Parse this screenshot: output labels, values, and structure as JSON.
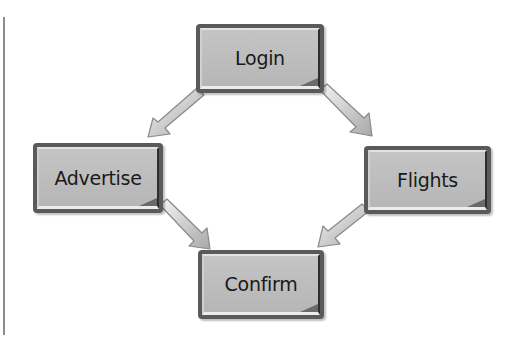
{
  "diagram": {
    "type": "flow",
    "nodes": [
      {
        "id": "login",
        "label": "Login"
      },
      {
        "id": "advertise",
        "label": "Advertise"
      },
      {
        "id": "flights",
        "label": "Flights"
      },
      {
        "id": "confirm",
        "label": "Confirm"
      }
    ],
    "edges": [
      {
        "from": "login",
        "to": "advertise"
      },
      {
        "from": "login",
        "to": "flights"
      },
      {
        "from": "advertise",
        "to": "confirm"
      },
      {
        "from": "flights",
        "to": "confirm"
      }
    ],
    "colors": {
      "box_fill": "#bdbdbd",
      "box_border": "#5a5a5a",
      "arrow_fill": "#d8d8d8",
      "arrow_stroke": "#8a8a8a",
      "text": "#1a1a1a"
    }
  }
}
